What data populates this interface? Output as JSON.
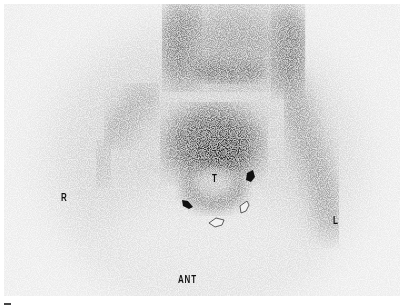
{
  "figure": {
    "type": "planar scintigraphy (grayscale, anterior view)",
    "background_color": "#ececec",
    "labels": {
      "right": "R",
      "left": "L",
      "view": "ANT",
      "target": "T"
    },
    "annotations": [
      {
        "type": "solid-arrow",
        "position": "upper-right of T"
      },
      {
        "type": "solid-arrow",
        "position": "lower-left of T"
      },
      {
        "type": "open-arrow",
        "position": "lower-right of T"
      },
      {
        "type": "open-arrow",
        "position": "below T"
      }
    ]
  }
}
